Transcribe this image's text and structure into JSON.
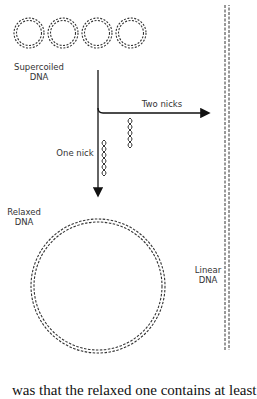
{
  "diagram": {
    "nodes": [
      {
        "id": "supercoiled",
        "label_line1": "Supercoiled",
        "label_line2": "DNA"
      },
      {
        "id": "relaxed",
        "label_line1": "Relaxed",
        "label_line2": "DNA"
      },
      {
        "id": "linear",
        "label_line1": "Linear",
        "label_line2": "DNA"
      }
    ],
    "edges": [
      {
        "from": "supercoiled",
        "to": "relaxed",
        "label": "One nick"
      },
      {
        "from": "supercoiled",
        "to": "linear",
        "label": "Two nicks"
      }
    ]
  },
  "caption_text": "was that the relaxed one contains at least"
}
